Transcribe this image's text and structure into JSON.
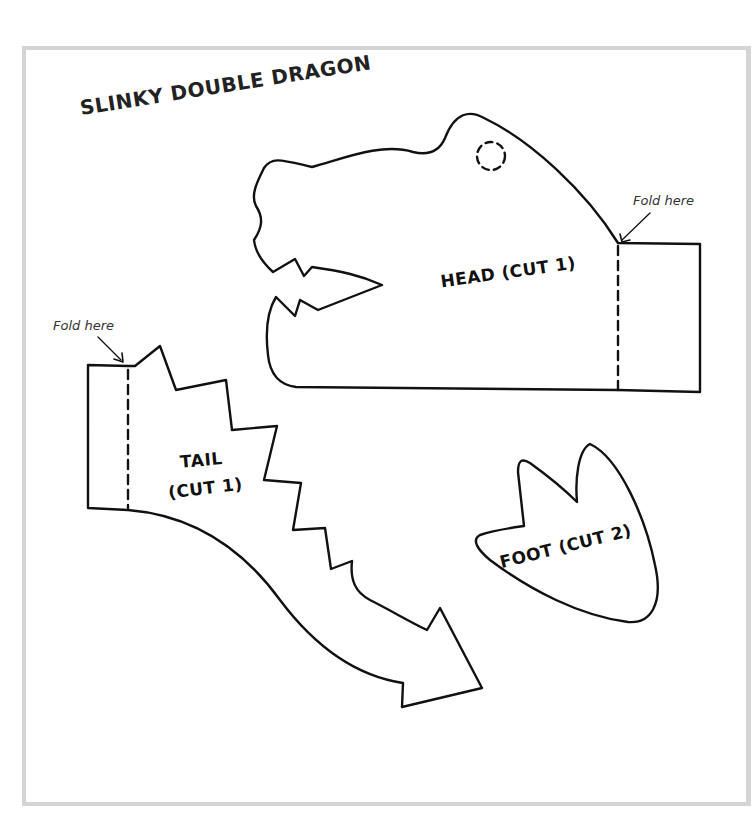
{
  "document": {
    "title": "SLINKY DOUBLE DRAGON",
    "pieces": [
      {
        "id": "head",
        "label": "HEAD (CUT 1)"
      },
      {
        "id": "tail",
        "label_line1": "TAIL",
        "label_line2": "(CUT 1)"
      },
      {
        "id": "foot",
        "label": "FOOT (CUT 2)"
      }
    ],
    "annotations": {
      "head_fold": "Fold here",
      "tail_fold": "Fold here"
    }
  },
  "colors": {
    "frame_border": "#d4d4d4",
    "outline": "#111111",
    "background": "#ffffff"
  }
}
